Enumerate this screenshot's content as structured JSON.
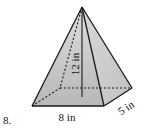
{
  "problem": {
    "number": "8."
  },
  "figure": {
    "shape": "rectangular pyramid",
    "height_label": "12 in",
    "base_length_label": "8 in",
    "base_width_label": "5 in",
    "colors": {
      "stroke": "#1a1a1a",
      "face_fill": "#c9c9c9",
      "face_light": "#e2e2e2",
      "face_dark": "#b5b5b5"
    }
  }
}
